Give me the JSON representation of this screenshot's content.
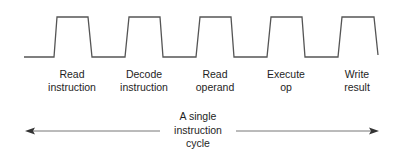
{
  "diagram": {
    "type": "timing-diagram",
    "waveform": {
      "low_y": 57,
      "high_y": 17,
      "pulses": 5,
      "color": "#555555"
    },
    "stages": [
      {
        "line1": "Read",
        "line2": "instruction"
      },
      {
        "line1": "Decode",
        "line2": "instruction"
      },
      {
        "line1": "Read",
        "line2": "operand"
      },
      {
        "line1": "Execute",
        "line2": "op"
      },
      {
        "line1": "Write",
        "line2": "result"
      }
    ],
    "cycle_label": {
      "line1": "A single",
      "line2": "instruction",
      "line3": "cycle"
    },
    "arrow": {
      "direction": "bidirectional",
      "color": "#666666"
    }
  }
}
